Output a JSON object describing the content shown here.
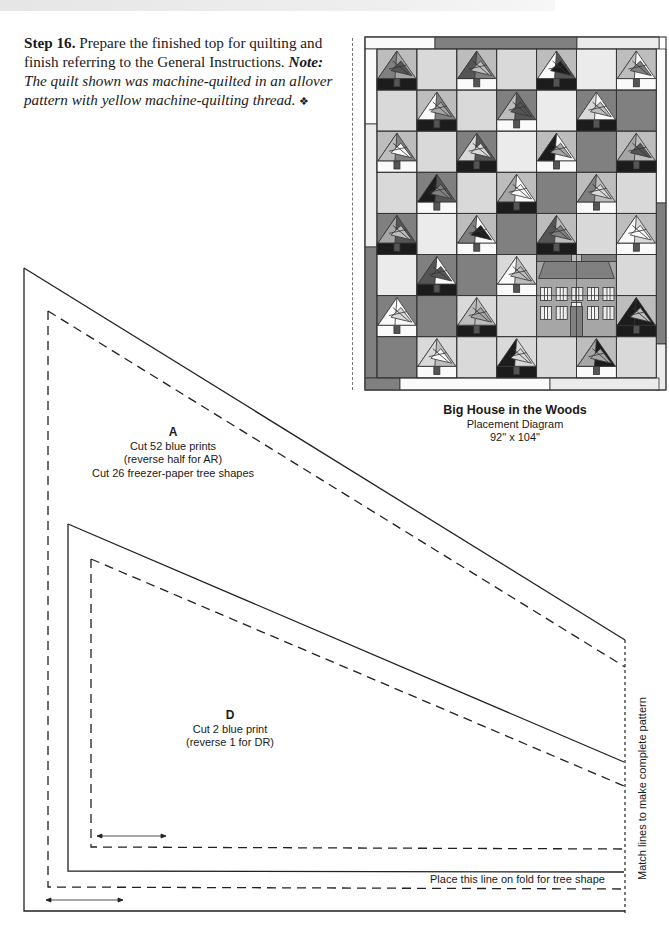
{
  "page": {
    "header_band": true
  },
  "instructions": {
    "step_label": "Step 16.",
    "step_text": " Prepare the finished top for quilting and finish referring to the General Instructions. ",
    "note_label": "Note:",
    "note_text": " The quilt shown was machine-quilted in an allover pattern with yellow machine-quilting thread. ",
    "end_symbol": "❖"
  },
  "diagram": {
    "title": "Big House in the Woods",
    "subtitle": "Placement Diagram",
    "size": "92\" x 104\"",
    "grid": {
      "columns": 7,
      "rows": 8
    },
    "colors": {
      "light": "#d9d9d9",
      "lighter": "#ebebeb",
      "medium": "#a6a6a6",
      "mid": "#bdbdbd",
      "dark": "#808080",
      "darker": "#555555",
      "black": "#1c1c1c",
      "white": "#fafafa"
    }
  },
  "pattern": {
    "piece_a": {
      "letter": "A",
      "line1": "Cut 52 blue prints",
      "line2": "(reverse half for AR)",
      "line3": "Cut 26 freezer-paper tree shapes"
    },
    "piece_d": {
      "letter": "D",
      "line1": "Cut 2 blue print",
      "line2": "(reverse 1 for DR)"
    },
    "fold_note": "Place this line on fold for tree shape",
    "match_note": "Match lines to make complete pattern"
  }
}
